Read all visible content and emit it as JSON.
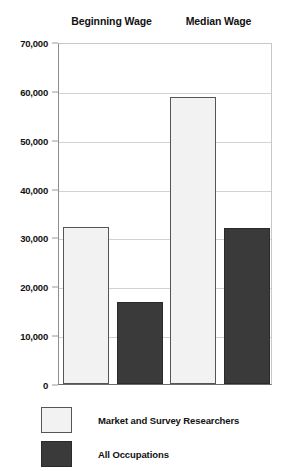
{
  "chart_data": {
    "type": "bar",
    "title": "",
    "xlabel": "",
    "ylabel": "",
    "ylim": [
      0,
      70000
    ],
    "ytick_labels": [
      "70,000",
      "60,000",
      "50,000",
      "40,000",
      "30,000",
      "20,000",
      "10,000",
      "0"
    ],
    "ytick_values": [
      70000,
      60000,
      50000,
      40000,
      30000,
      20000,
      10000,
      0
    ],
    "grid": true,
    "legend_position": "bottom-left",
    "categories": [
      "Beginning Wage",
      "Median Wage"
    ],
    "series": [
      {
        "name": "Market and Survey Researchers",
        "color": "#f2f2f2",
        "values": [
          32200,
          58700
        ]
      },
      {
        "name": "All Occupations",
        "color": "#3a3a3a",
        "values": [
          16800,
          32000
        ]
      }
    ]
  },
  "legend": {
    "items": [
      {
        "label": "Market and Survey Researchers",
        "swatch": "light"
      },
      {
        "label": "All Occupations",
        "swatch": "dark"
      }
    ]
  }
}
